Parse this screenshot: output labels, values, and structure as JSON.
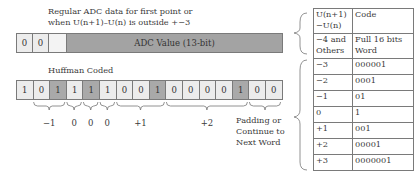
{
  "top_caption": {
    "line1": "Regular ADC data for first point or",
    "line2": "when U(n+1)–U(n) is outside +−3"
  },
  "adc_word": {
    "bits": [
      "0",
      "0",
      ""
    ],
    "value_label": "ADC Value (13-bit)"
  },
  "huffman_caption": "Huffman Coded",
  "huffman_word": {
    "bits": [
      {
        "v": "1",
        "shade": "light"
      },
      {
        "v": "0",
        "shade": "light"
      },
      {
        "v": "1",
        "shade": "dark"
      },
      {
        "v": "1",
        "shade": "light"
      },
      {
        "v": "1",
        "shade": "dark"
      },
      {
        "v": "1",
        "shade": "light"
      },
      {
        "v": "0",
        "shade": "light"
      },
      {
        "v": "0",
        "shade": "light"
      },
      {
        "v": "1",
        "shade": "dark"
      },
      {
        "v": "0",
        "shade": "light"
      },
      {
        "v": "0",
        "shade": "light"
      },
      {
        "v": "0",
        "shade": "light"
      },
      {
        "v": "0",
        "shade": "light"
      },
      {
        "v": "1",
        "shade": "dark"
      },
      {
        "v": "0",
        "shade": "light"
      },
      {
        "v": "0",
        "shade": "light"
      }
    ],
    "groups": [
      {
        "label": "−1",
        "from": 1,
        "to": 2
      },
      {
        "label": "0",
        "from": 3,
        "to": 3
      },
      {
        "label": "0",
        "from": 4,
        "to": 4
      },
      {
        "label": "0",
        "from": 5,
        "to": 5
      },
      {
        "label": "+1",
        "from": 6,
        "to": 8
      },
      {
        "label": "+2",
        "from": 9,
        "to": 13
      }
    ],
    "padding_label": {
      "line1": "Padding or",
      "line2": "Continue to",
      "line3": "Next Word"
    }
  },
  "code_table": {
    "header": {
      "col1_line1": "U(n+1)",
      "col1_line2": "−U(n)",
      "col2": "Code"
    },
    "escape_row": {
      "col1_line1": "−4 and",
      "col1_line2": "Others",
      "col2_line1": "Full 16 bits",
      "col2_line2": "Word"
    },
    "rows": [
      {
        "diff": "−3",
        "code": "000001"
      },
      {
        "diff": "−2",
        "code": "0001"
      },
      {
        "diff": "−1",
        "code": "01"
      },
      {
        "diff": "0",
        "code": "1"
      },
      {
        "diff": "+1",
        "code": "001"
      },
      {
        "diff": "+2",
        "code": "00001"
      },
      {
        "diff": "+3",
        "code": "0000001"
      }
    ]
  },
  "colors": {
    "light_cell": "#ececec",
    "dark_cell": "#a9a9a9",
    "adc_fill": "#a3a3a3",
    "border": "#7a7a7a"
  }
}
